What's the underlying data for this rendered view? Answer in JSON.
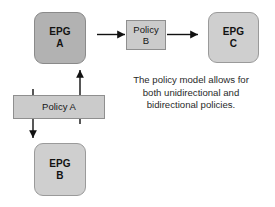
{
  "diagram": {
    "background_color": "#ffffff",
    "nodes": {
      "epg_a": {
        "line1": "EPG",
        "line2": "A",
        "shape": "rounded-rectangle",
        "fill": "#b2b2b2",
        "stroke": "#8a8a8a"
      },
      "epg_b": {
        "line1": "EPG",
        "line2": "B",
        "shape": "rounded-rectangle",
        "fill": "#cfcfcf",
        "stroke": "#9a9a9a"
      },
      "epg_c": {
        "line1": "EPG",
        "line2": "C",
        "shape": "rounded-rectangle",
        "fill": "#cfcfcf",
        "stroke": "#9a9a9a"
      },
      "policy_b": {
        "line1": "Policy",
        "line2": "B",
        "shape": "rectangle",
        "fill": "#cbcbcb",
        "stroke": "#8f8f8f"
      },
      "policy_a": {
        "label": "Policy A",
        "shape": "rectangle",
        "fill": "#cbcbcb",
        "stroke": "#8f8f8f"
      }
    },
    "connectors": {
      "policy_b_to_epg_a": {
        "direction": "left",
        "style": "arrow",
        "color": "#111111"
      },
      "policy_b_to_epg_c": {
        "direction": "right",
        "style": "arrow",
        "color": "#111111"
      },
      "policy_a_to_epg_a": {
        "direction": "up",
        "style": "arrow",
        "color": "#111111"
      },
      "policy_a_to_epg_b": {
        "direction": "down",
        "style": "arrow",
        "color": "#111111"
      }
    },
    "caption": {
      "line1": "The policy model allows for",
      "line2": "both unidirectional and",
      "line3": "bidirectional policies."
    }
  }
}
